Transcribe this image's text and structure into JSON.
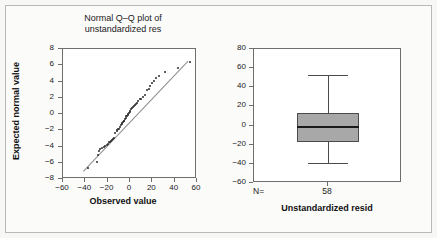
{
  "figure": {
    "background_color": "#f7f7f5",
    "border_color": "#b9b9b9"
  },
  "chart_data": [
    {
      "type": "scatter",
      "name": "normal-qq-plot",
      "title": "Normal Q–Q plot of\nunstandardized res",
      "title_line1": "Normal Q–Q plot of",
      "title_line2": "unstandardized res",
      "xlabel": "Observed value",
      "ylabel": "Expected normal value",
      "xlim": [
        -60,
        60
      ],
      "ylim": [
        -8,
        8
      ],
      "xticks": [
        -60,
        -40,
        -20,
        0,
        20,
        40,
        60
      ],
      "yticks": [
        8,
        6,
        4,
        2,
        0,
        -2,
        -4,
        -6,
        -8
      ],
      "xticklabels": [
        "-60",
        "-40",
        "-20",
        "0",
        "20",
        "40",
        "60"
      ],
      "yticklabels": [
        "8",
        "6",
        "4",
        "2",
        "0",
        "-2",
        "-4",
        "-6",
        "-8"
      ],
      "grid": false,
      "legend": false,
      "point_color": "#2b2b2b",
      "line_color": "#8e8e8e",
      "reference_line": {
        "x0": -42,
        "y0": -7.0,
        "x1": 52,
        "y1": 6.6
      },
      "n": 58,
      "points": [
        [
          -38.0,
          -6.6
        ],
        [
          -29.5,
          -5.9
        ],
        [
          -28.6,
          -5.0
        ],
        [
          -27.8,
          -4.6
        ],
        [
          -27.0,
          -4.3
        ],
        [
          -25.0,
          -4.2
        ],
        [
          -23.4,
          -4.0
        ],
        [
          -22.2,
          -3.9
        ],
        [
          -21.0,
          -3.8
        ],
        [
          -20.0,
          -3.7
        ],
        [
          -19.0,
          -3.5
        ],
        [
          -18.2,
          -3.4
        ],
        [
          -17.2,
          -3.3
        ],
        [
          -16.3,
          -3.2
        ],
        [
          -15.4,
          -3.1
        ],
        [
          -14.6,
          -3.0
        ],
        [
          -13.0,
          -2.3
        ],
        [
          -12.0,
          -2.1
        ],
        [
          -11.2,
          -2.0
        ],
        [
          -10.4,
          -1.9
        ],
        [
          -9.6,
          -1.8
        ],
        [
          -8.9,
          -1.6
        ],
        [
          -8.2,
          -1.4
        ],
        [
          -7.5,
          -1.2
        ],
        [
          -6.9,
          -1.1
        ],
        [
          -6.3,
          -1.0
        ],
        [
          -5.8,
          -0.9
        ],
        [
          -5.2,
          -0.8
        ],
        [
          -4.6,
          -0.6
        ],
        [
          -4.0,
          -0.5
        ],
        [
          -3.4,
          -0.3
        ],
        [
          -2.8,
          -0.2
        ],
        [
          -2.2,
          -0.1
        ],
        [
          -1.6,
          0.0
        ],
        [
          -1.0,
          0.1
        ],
        [
          -0.4,
          0.2
        ],
        [
          0.3,
          0.4
        ],
        [
          1.0,
          0.6
        ],
        [
          1.8,
          0.8
        ],
        [
          2.6,
          0.9
        ],
        [
          3.4,
          1.0
        ],
        [
          4.3,
          1.1
        ],
        [
          5.2,
          1.2
        ],
        [
          6.2,
          1.4
        ],
        [
          7.4,
          1.6
        ],
        [
          8.8,
          1.8
        ],
        [
          10.0,
          1.9
        ],
        [
          11.6,
          2.1
        ],
        [
          13.2,
          2.3
        ],
        [
          15.0,
          2.9
        ],
        [
          16.6,
          3.1
        ],
        [
          18.2,
          3.4
        ],
        [
          20.0,
          3.8
        ],
        [
          21.6,
          4.1
        ],
        [
          23.6,
          4.4
        ],
        [
          26.4,
          4.7
        ],
        [
          31.0,
          5.2
        ],
        [
          43.0,
          5.7
        ],
        [
          54.0,
          6.4
        ]
      ]
    },
    {
      "type": "box",
      "name": "boxplot-unstandardized-resid",
      "title": "",
      "xlabel": "Unstandardized resid",
      "ylabel": "",
      "ylim": [
        -60,
        80
      ],
      "yticks": [
        80,
        60,
        40,
        20,
        0,
        -20,
        -40,
        -60
      ],
      "yticklabels": [
        "80",
        "60",
        "40",
        "20",
        "0",
        "-20",
        "-40",
        "-60"
      ],
      "grid": false,
      "legend": false,
      "box_fill": "#a8a8a8",
      "box_edge": "#4a4a4a",
      "median_color": "#1a1a1a",
      "categories": [
        "Unstandardized resid"
      ],
      "n_label": "N=",
      "n_value": "58",
      "boxes": [
        {
          "category": "Unstandardized resid",
          "whisker_low": -39,
          "q1": -17,
          "median": -2,
          "q3": 13,
          "whisker_high": 53,
          "n": 58
        }
      ]
    }
  ]
}
